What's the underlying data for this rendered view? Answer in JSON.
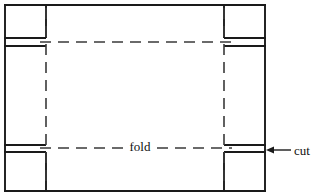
{
  "figure": {
    "type": "net-diagram",
    "background_color": "#ffffff",
    "line_color": "#1a1a1a",
    "dash_color": "#3a3a3a"
  },
  "labels": {
    "fold": "fold",
    "cut": "cut"
  },
  "geometry": {
    "outer": {
      "left": 4,
      "top": 4,
      "right": 266,
      "bottom": 192
    },
    "horizontal_solid_y": [
      4,
      38,
      46,
      145,
      152,
      192
    ],
    "vertical_solid_x": [
      4,
      46,
      224,
      266
    ],
    "fold_lines_horizontal_y": [
      42,
      148
    ],
    "fold_lines_vertical_x": [
      46,
      224
    ],
    "flap_corners": [
      {
        "name": "top-left",
        "left": 4,
        "top": 4,
        "right": 46,
        "bottom": 38
      },
      {
        "name": "top-right",
        "left": 224,
        "top": 4,
        "right": 266,
        "bottom": 38
      },
      {
        "name": "bottom-left",
        "left": 4,
        "top": 152,
        "right": 46,
        "bottom": 192
      },
      {
        "name": "bottom-right",
        "left": 224,
        "top": 152,
        "right": 266,
        "bottom": 192
      }
    ],
    "fold_label_anchor": {
      "x": 140,
      "y": 150
    },
    "cut_label_anchor": {
      "x": 294,
      "y": 155
    },
    "cut_arrow": {
      "from_x": 291,
      "from_y": 150,
      "to_x": 268,
      "to_y": 150
    }
  }
}
